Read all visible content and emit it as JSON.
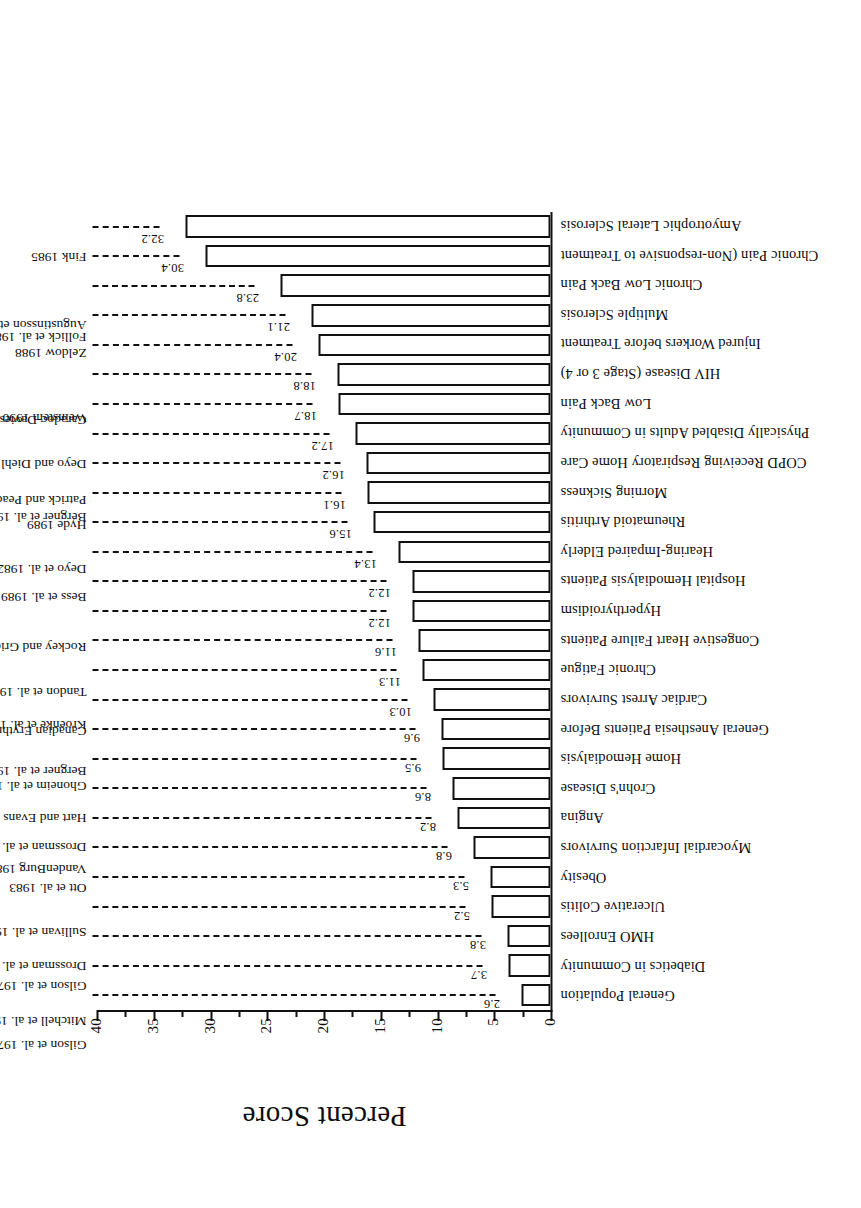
{
  "chart_data": {
    "type": "bar",
    "title": "",
    "xlabel": "",
    "ylabel": "Percent Score",
    "ylim": [
      0,
      40
    ],
    "yticks": [
      0,
      5,
      10,
      15,
      20,
      25,
      30,
      35,
      40
    ],
    "ytick_labels": [
      "0",
      "5",
      "10",
      "15",
      "20",
      "25",
      "30",
      "35",
      "40"
    ],
    "grid": false,
    "legend": null,
    "orientation": "vertical-bars-on-rotated-page",
    "categories": [
      "General Population",
      "Diabetics in Community",
      "HMO Enrollees",
      "Ulcerative Colitis",
      "Obesity",
      "Myocardial Infarction Survivors",
      "Angina",
      "Crohn's Disease",
      "Home Hemodialysis",
      "General Anesthesia Patients Before",
      "Cardiac Arrest Survivors",
      "Chronic Fatigue",
      "Congestive Heart Failure Patients",
      "Hyperthyroidism",
      "Hospital Hemodialysis Patients",
      "Hearing-Impaired Elderly",
      "Rheumatoid Arthritis",
      "Morning Sickness",
      "COPD Receiving Respiratory Home Care",
      "Physically Disabled Adults in Community",
      "Low Back Pain",
      "HIV Disease (Stage 3 or 4)",
      "Injured Workers before Treatment",
      "Multiple Sclerosis",
      "Chronic Low Back Pain",
      "Chronic Pain (Non-responsive to Treatment",
      "Amyotrophic Lateral Sclerosis"
    ],
    "values": [
      2.6,
      3.7,
      3.8,
      5.2,
      5.3,
      6.8,
      8.2,
      8.6,
      9.5,
      9.6,
      10.3,
      11.3,
      11.6,
      12.2,
      12.2,
      13.4,
      15.6,
      16.1,
      16.2,
      17.2,
      18.7,
      18.8,
      20.4,
      21.1,
      23.8,
      30.4,
      32.2
    ],
    "value_labels": [
      "2.6",
      "3.7",
      "3.8",
      "5.2",
      "5.3",
      "6.8",
      "8.2",
      "8.6",
      "9.5",
      "9.6",
      "10.3",
      "11.3",
      "11.6",
      "12.2",
      "12.2",
      "13.4",
      "15.6",
      "16.1",
      "16.2",
      "17.2",
      "18.7",
      "18.8",
      "20.4",
      "21.1",
      "23.8",
      "30.4",
      "32.2"
    ],
    "annotations": [
      "Gilson et al. 1979",
      "Mitchell et al. 1990",
      "Gilson et al. 1979",
      "Drossman et al. 1989",
      "Sullivan et al. 1987",
      "Ott et al. 1983",
      "VandenBurg 1988",
      "Drossman et al. 1989",
      "Hart and Evans 1987",
      "Ghoneim et al. 1988",
      "Bergner et al. 1984; 1985",
      "Kroenke et al. 1988",
      "Tandon et al. 1989",
      "Canadian Erythropoietin Study Group 1990",
      "Rockey and Griep 1980",
      "Bess et al. 1989",
      "Deyo et al. 1982",
      "Hyde 1989",
      "Bergner et al. 1988",
      "Patrick and Peach 1989",
      "Deyo and Diehl 1983",
      "Weinstein 1990",
      "Caradoc-Davies et al. 1990",
      "Zeldow 1988",
      "Follick et al. 1985",
      "Augustinsson et al. 1986",
      "Fink 1985"
    ],
    "colors": {
      "bar_fill": "#ffffff",
      "bar_edge": "#111111",
      "axis": "#111111",
      "text": "#0d0d0d",
      "background": "#ffffff"
    }
  }
}
